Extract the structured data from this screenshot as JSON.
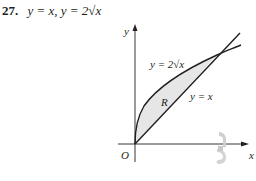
{
  "problem": {
    "number": "27.",
    "equation": "y = x, y = 2√x"
  },
  "figure": {
    "axis_labels": {
      "x": "x",
      "y": "y",
      "origin": "O"
    },
    "curve_labels": {
      "sqrt": "y = 2√x",
      "linear": "y = x"
    },
    "region_label": "R",
    "colors": {
      "ink": "#231f20",
      "region_fill": "#e6e6e6",
      "rotation_icon": "#c8c8c8"
    },
    "icons": [
      "rotation-arrow-icon"
    ]
  }
}
